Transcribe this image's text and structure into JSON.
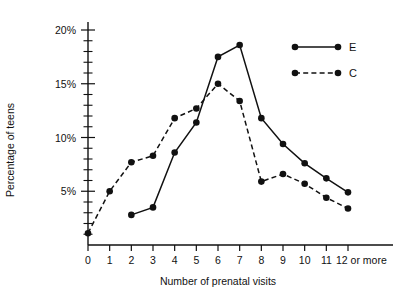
{
  "chart_data": {
    "type": "line",
    "title": "",
    "xlabel": "Number of prenatal visits",
    "ylabel": "Percentage of teens",
    "x": [
      0,
      1,
      2,
      3,
      4,
      5,
      6,
      7,
      8,
      9,
      10,
      11,
      12
    ],
    "xtick_labels": [
      "0",
      "1",
      "2",
      "3",
      "4",
      "5",
      "6",
      "7",
      "8",
      "9",
      "10",
      "11",
      "12 or more"
    ],
    "ytick_labels": [
      "5%",
      "10%",
      "15%",
      "20%"
    ],
    "ytick_values": [
      5,
      10,
      15,
      20
    ],
    "ylim": [
      0,
      21
    ],
    "xlim": [
      -0.45,
      12.6
    ],
    "minor_tick_step": 1,
    "grid": false,
    "legend_position": "top-right",
    "series": [
      {
        "name": "E",
        "style": "solid",
        "marker": "filled-circle",
        "x": [
          2,
          3,
          4,
          5,
          6,
          7,
          8,
          9,
          10,
          11,
          12
        ],
        "values": [
          2.8,
          3.5,
          8.6,
          11.4,
          17.5,
          18.6,
          11.8,
          9.4,
          7.6,
          6.2,
          4.9
        ]
      },
      {
        "name": "C",
        "style": "dashed",
        "marker": "filled-circle",
        "x": [
          0,
          1,
          2,
          3,
          4,
          5,
          6,
          7,
          8,
          9,
          10,
          11,
          12
        ],
        "values": [
          1.1,
          5.0,
          7.7,
          8.3,
          11.8,
          12.7,
          15.0,
          13.4,
          5.9,
          6.6,
          5.7,
          4.4,
          3.4
        ]
      }
    ]
  },
  "legend": {
    "entries": [
      {
        "label": "E",
        "style": "solid"
      },
      {
        "label": "C",
        "style": "dashed"
      }
    ]
  }
}
